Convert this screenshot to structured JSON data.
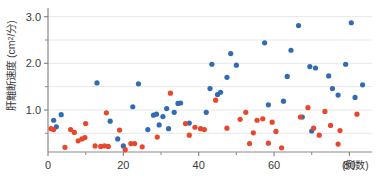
{
  "chart_data": {
    "type": "scatter",
    "title": "",
    "xlabel": "(例数)",
    "ylabel": "肝離断速度 (cm2/分)",
    "ylabel_main": "肝離断速度 (cm",
    "ylabel_sup": "2",
    "ylabel_tail": "/分)",
    "xlim": [
      0,
      86
    ],
    "ylim": [
      0.1,
      3.1
    ],
    "xticks": [
      0,
      20,
      40,
      60,
      80
    ],
    "xticklabels": [
      "0",
      "20",
      "40",
      "60",
      "80"
    ],
    "xminorticks": [
      10,
      30,
      50,
      70
    ],
    "yticks": [
      1.0,
      2.0,
      3.0
    ],
    "yticklabels": [
      "1.0",
      "2.0",
      "3.0"
    ],
    "yminorticks": [
      0.5,
      1.5,
      2.5
    ],
    "gridlines_y": [
      0.5,
      1.0,
      1.5,
      2.0,
      2.5,
      3.0
    ],
    "grid": true,
    "legend": "none",
    "colors": {
      "series_blue": "#2F6CB3",
      "series_red": "#E8472C",
      "grid": "#E6E8EA",
      "axis": "#8A8A8A",
      "text": "#3A3A3A",
      "background": "#FFFFFF"
    },
    "marker": {
      "shape": "circle",
      "size_px": 5.2
    },
    "series": [
      {
        "name": "blue",
        "color": "#2F6CB3",
        "points": [
          [
            1.5,
            0.78
          ],
          [
            2.2,
            0.64
          ],
          [
            3.5,
            0.9
          ],
          [
            13.0,
            1.58
          ],
          [
            16.5,
            0.76
          ],
          [
            18.5,
            0.38
          ],
          [
            20.0,
            0.23
          ],
          [
            22.5,
            1.07
          ],
          [
            24.0,
            1.56
          ],
          [
            26.5,
            0.58
          ],
          [
            28.0,
            0.89
          ],
          [
            28.8,
            0.91
          ],
          [
            29.5,
            0.68
          ],
          [
            30.5,
            0.86
          ],
          [
            31.5,
            1.03
          ],
          [
            32.0,
            0.6
          ],
          [
            33.5,
            0.95
          ],
          [
            34.5,
            1.14
          ],
          [
            35.2,
            1.15
          ],
          [
            37.5,
            0.72
          ],
          [
            42.0,
            0.95
          ],
          [
            43.0,
            1.46
          ],
          [
            43.5,
            1.98
          ],
          [
            45.0,
            1.33
          ],
          [
            45.8,
            1.38
          ],
          [
            47.5,
            1.7
          ],
          [
            48.5,
            2.21
          ],
          [
            50.0,
            1.96
          ],
          [
            57.5,
            2.44
          ],
          [
            58.5,
            1.11
          ],
          [
            62.5,
            1.19
          ],
          [
            63.5,
            1.72
          ],
          [
            64.5,
            2.28
          ],
          [
            66.5,
            2.81
          ],
          [
            67.5,
            0.85
          ],
          [
            69.5,
            1.93
          ],
          [
            70.0,
            0.55
          ],
          [
            71.0,
            1.9
          ],
          [
            74.5,
            1.73
          ],
          [
            75.5,
            1.46
          ],
          [
            77.0,
            1.32
          ],
          [
            79.0,
            1.98
          ],
          [
            80.5,
            2.87
          ],
          [
            81.5,
            1.27
          ],
          [
            83.5,
            1.54
          ]
        ]
      },
      {
        "name": "red",
        "color": "#E8472C",
        "points": [
          [
            0.8,
            0.6
          ],
          [
            1.5,
            0.58
          ],
          [
            4.5,
            0.2
          ],
          [
            6.0,
            0.58
          ],
          [
            7.0,
            0.52
          ],
          [
            8.0,
            0.34
          ],
          [
            9.0,
            0.38
          ],
          [
            9.8,
            0.41
          ],
          [
            10.0,
            0.71
          ],
          [
            12.5,
            0.23
          ],
          [
            14.0,
            0.22
          ],
          [
            15.0,
            0.23
          ],
          [
            15.5,
            0.94
          ],
          [
            16.0,
            0.22
          ],
          [
            19.0,
            0.57
          ],
          [
            20.5,
            0.15
          ],
          [
            22.0,
            0.28
          ],
          [
            23.0,
            0.28
          ],
          [
            25.0,
            0.21
          ],
          [
            29.0,
            0.42
          ],
          [
            32.5,
            1.36
          ],
          [
            36.5,
            0.71
          ],
          [
            37.5,
            0.46
          ],
          [
            39.0,
            0.63
          ],
          [
            40.5,
            0.6
          ],
          [
            41.5,
            0.58
          ],
          [
            44.5,
            1.21
          ],
          [
            47.5,
            0.61
          ],
          [
            51.0,
            0.8
          ],
          [
            52.5,
            0.95
          ],
          [
            53.5,
            0.28
          ],
          [
            54.5,
            0.51
          ],
          [
            55.5,
            0.78
          ],
          [
            57.0,
            0.81
          ],
          [
            58.5,
            0.29
          ],
          [
            59.5,
            0.74
          ],
          [
            60.5,
            0.54
          ],
          [
            62.0,
            0.19
          ],
          [
            67.0,
            0.85
          ],
          [
            69.0,
            1.05
          ],
          [
            70.5,
            0.61
          ],
          [
            72.0,
            0.46
          ],
          [
            73.5,
            0.97
          ],
          [
            75.0,
            0.67
          ],
          [
            77.0,
            0.27
          ],
          [
            77.5,
            0.56
          ],
          [
            82.0,
            0.91
          ]
        ]
      }
    ]
  }
}
